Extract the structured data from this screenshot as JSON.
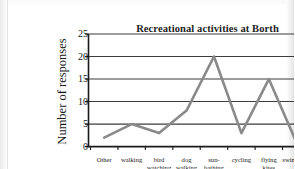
{
  "chart_data": {
    "type": "line",
    "title": "Recreational activities at Borth",
    "xlabel": "",
    "ylabel": "Number of responses",
    "categories": [
      "Other",
      "walking",
      "bird watching",
      "dog walking",
      "sun-bathing",
      "cycling",
      "flying kites",
      "swimming"
    ],
    "category_lines": [
      [
        "Other"
      ],
      [
        "walking"
      ],
      [
        "bird",
        "watching"
      ],
      [
        "dog",
        "walking"
      ],
      [
        "sun-",
        "bathing"
      ],
      [
        "cycling"
      ],
      [
        "flying",
        "kites"
      ],
      [
        "swimming"
      ]
    ],
    "values": [
      2,
      5,
      3,
      8,
      20,
      3,
      15,
      1
    ],
    "ylim": [
      0,
      25
    ],
    "ytick_labels": [
      "0",
      "5",
      "10",
      "15",
      "20",
      "25"
    ],
    "ytick_values": [
      0,
      5,
      10,
      15,
      20,
      25
    ],
    "grid": true,
    "legend": false,
    "series_color": "#8a8a8a",
    "axis_color": "#1a1a1a",
    "gridline_color": "#3d3d3d",
    "background_color": "#ffffff"
  }
}
